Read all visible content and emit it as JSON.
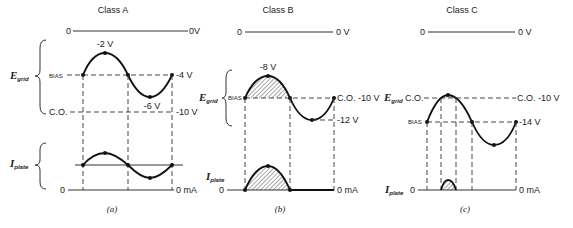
{
  "panels": [
    {
      "id": "a",
      "title": "Class A",
      "caption": "(a)",
      "zero_left": "0",
      "zero_right": "0V",
      "grid_label": "E",
      "grid_sub": "grid",
      "bias_label": "BIAS",
      "co_label": "C.O.",
      "peak_label": "-2 V",
      "trough_label": "-6 V",
      "bias_value": "-4 V",
      "co_value": "-10 V",
      "plate_label": "I",
      "plate_sub": "plate",
      "plate_zero_left": "0",
      "plate_zero_right": "0 mA"
    },
    {
      "id": "b",
      "title": "Class B",
      "caption": "(b)",
      "zero_left": "0",
      "zero_right": "0 V",
      "grid_label": "E",
      "grid_sub": "grid",
      "bias_label": "BIAS",
      "peak_label": "-8 V",
      "bias_value": "C.O. -10 V",
      "trough_value": "-12 V",
      "plate_label": "I",
      "plate_sub": "plate",
      "plate_zero_left": "0",
      "plate_zero_right": "0 mA"
    },
    {
      "id": "c",
      "title": "Class C",
      "caption": "(c)",
      "zero_left": "0",
      "zero_right": "0 V",
      "grid_label": "E",
      "grid_sub": "grid",
      "co_label": "C.O.",
      "co_value": "C.O. -10 V",
      "bias_label": "BIAS",
      "bias_value": "-14 V",
      "plate_label": "I",
      "plate_sub": "plate",
      "plate_zero_left": "0",
      "plate_zero_right": "0 mA"
    }
  ]
}
